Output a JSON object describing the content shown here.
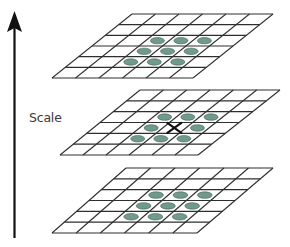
{
  "diagram": {
    "type": "scale-space-extrema-detection",
    "axis": {
      "label": "Scale",
      "direction": "up",
      "x": 14.5,
      "y_top": 11,
      "y_bottom": 238,
      "color": "#111111"
    },
    "grid_style": {
      "rows": 6,
      "cols": 6,
      "line_color": "#2e2e2e",
      "line_width": 1.1
    },
    "marker_style": {
      "fill": "#6f9a8c",
      "stroke": "#3f6157",
      "rx_ratio": 0.3,
      "ry_ratio": 0.3
    },
    "center_marker": {
      "symbol": "X",
      "color": "#111111"
    },
    "layers": [
      {
        "name": "upper-scale",
        "corners": {
          "tl": [
            132,
            14
          ],
          "tr": [
            273,
            14
          ],
          "br": [
            193,
            78
          ],
          "bl": [
            52,
            78
          ]
        },
        "neighbors": [
          [
            2,
            2
          ],
          [
            2,
            3
          ],
          [
            2,
            4
          ],
          [
            3,
            2
          ],
          [
            3,
            3
          ],
          [
            3,
            4
          ],
          [
            4,
            2
          ],
          [
            4,
            3
          ],
          [
            4,
            4
          ]
        ],
        "sample_point": null
      },
      {
        "name": "current-scale",
        "corners": {
          "tl": [
            140,
            90
          ],
          "tr": [
            280,
            90
          ],
          "br": [
            198,
            155
          ],
          "bl": [
            60,
            155
          ]
        },
        "neighbors": [
          [
            2,
            2
          ],
          [
            2,
            3
          ],
          [
            2,
            4
          ],
          [
            3,
            2
          ],
          [
            3,
            4
          ],
          [
            4,
            2
          ],
          [
            4,
            3
          ],
          [
            4,
            4
          ]
        ],
        "sample_point": [
          3,
          3
        ]
      },
      {
        "name": "lower-scale",
        "corners": {
          "tl": [
            126,
            168
          ],
          "tr": [
            273,
            168
          ],
          "br": [
            197,
            233
          ],
          "bl": [
            52,
            233
          ]
        },
        "neighbors": [
          [
            2,
            2
          ],
          [
            2,
            3
          ],
          [
            2,
            4
          ],
          [
            3,
            2
          ],
          [
            3,
            3
          ],
          [
            3,
            4
          ],
          [
            4,
            2
          ],
          [
            4,
            3
          ],
          [
            4,
            4
          ]
        ],
        "sample_point": null
      }
    ]
  }
}
